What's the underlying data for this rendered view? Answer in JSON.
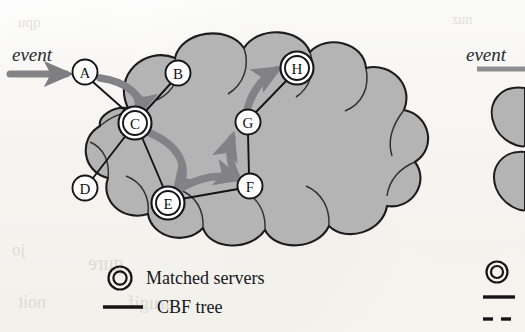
{
  "figure": {
    "kind": "network-cloud-diagram",
    "caption_visible": false,
    "background_color": "#fbfaf7",
    "cloud_fill": "#b4b4b4",
    "cloud_stroke": "#1d1d1f",
    "node_fill": "#ffffff",
    "node_stroke": "#151517",
    "edge_color": "#141416",
    "arrow_color": "#808084"
  },
  "left_figure": {
    "event_label": "event",
    "nodes": [
      {
        "id": "A",
        "label": "A",
        "x": 85,
        "y": 72,
        "matched": false
      },
      {
        "id": "B",
        "label": "B",
        "x": 178,
        "y": 73,
        "matched": false
      },
      {
        "id": "C",
        "label": "C",
        "x": 135,
        "y": 123,
        "matched": true
      },
      {
        "id": "D",
        "label": "D",
        "x": 85,
        "y": 188,
        "matched": false
      },
      {
        "id": "E",
        "label": "E",
        "x": 168,
        "y": 203,
        "matched": true
      },
      {
        "id": "F",
        "label": "F",
        "x": 250,
        "y": 186,
        "matched": false
      },
      {
        "id": "G",
        "label": "G",
        "x": 248,
        "y": 122,
        "matched": false
      },
      {
        "id": "H",
        "label": "H",
        "x": 297,
        "y": 68,
        "matched": true
      }
    ],
    "edges": [
      {
        "from": "A",
        "to": "C"
      },
      {
        "from": "B",
        "to": "C"
      },
      {
        "from": "C",
        "to": "D"
      },
      {
        "from": "C",
        "to": "E"
      },
      {
        "from": "E",
        "to": "F"
      },
      {
        "from": "F",
        "to": "G"
      },
      {
        "from": "G",
        "to": "H"
      }
    ],
    "flow_arrows": [
      {
        "from": "event",
        "to": "A"
      },
      {
        "from": "A",
        "to": "C"
      },
      {
        "from": "C",
        "to": "E"
      },
      {
        "from": "E",
        "to": "F"
      },
      {
        "from": "F",
        "to": "G"
      },
      {
        "from": "G",
        "to": "H"
      }
    ],
    "legend": [
      {
        "symbol": "double-circle",
        "label": "Matched servers"
      },
      {
        "symbol": "solid-line",
        "label": "CBF tree"
      }
    ]
  },
  "right_figure": {
    "partial": true,
    "event_label": "event",
    "legend": [
      {
        "symbol": "double-circle",
        "label": ""
      },
      {
        "symbol": "solid-line",
        "label": ""
      },
      {
        "symbol": "dashed-line",
        "label": ""
      }
    ]
  },
  "bleed_through": [
    {
      "text": "qpu",
      "x": 18,
      "y": 22,
      "size": 15
    },
    {
      "text": "nuz",
      "x": 452,
      "y": 20,
      "size": 14
    },
    {
      "text": "jo",
      "x": 12,
      "y": 248,
      "size": 17
    },
    {
      "text": "gure",
      "x": 88,
      "y": 262,
      "size": 20
    },
    {
      "text": "noit",
      "x": 18,
      "y": 300,
      "size": 18
    },
    {
      "text": "arugif",
      "x": 128,
      "y": 300,
      "size": 19
    }
  ]
}
